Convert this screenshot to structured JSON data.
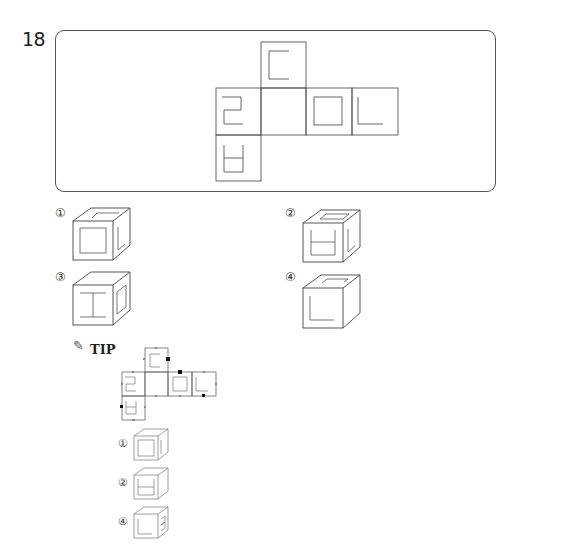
{
  "question": {
    "number": "18"
  },
  "net": {
    "description": "Cube net: top square above middle; middle row of four squares; one square below the leftmost",
    "faces": [
      {
        "position": "top",
        "symbol": "C-shape (open right)"
      },
      {
        "position": "middle-1",
        "symbol": "2-shape"
      },
      {
        "position": "middle-2",
        "symbol": "blank"
      },
      {
        "position": "middle-3",
        "symbol": "small square"
      },
      {
        "position": "middle-4",
        "symbol": "L-shape"
      },
      {
        "position": "bottom",
        "symbol": "U-shape with horizontal bar"
      }
    ]
  },
  "options": [
    {
      "label": "①",
      "front": "square",
      "right": "L-shape",
      "top": "bracket"
    },
    {
      "label": "②",
      "front": "U with bar",
      "right": "L-shape",
      "top": "bracket"
    },
    {
      "label": "③",
      "front": "I-bar",
      "right": "square",
      "top": "blank"
    },
    {
      "label": "④",
      "front": "L-shape",
      "right": "blank",
      "top": "bracket"
    }
  ],
  "tip": {
    "label": "TIP",
    "icon": "pencil-star-icon",
    "options": [
      {
        "label": "①"
      },
      {
        "label": "②"
      },
      {
        "label": "④"
      }
    ]
  }
}
